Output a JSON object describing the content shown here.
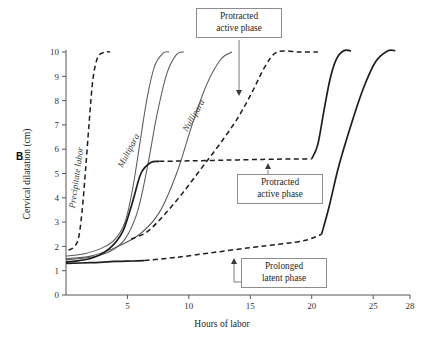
{
  "panel_label": "B",
  "axes": {
    "y_title": "Cervical dilatation (cm)",
    "x_title": "Hours of labor",
    "y_ticks": [
      "0",
      "1",
      "2",
      "3",
      "4",
      "5",
      "6",
      "7",
      "8",
      "9",
      "10"
    ],
    "x_ticks": [
      "5",
      "10",
      "15",
      "20",
      "25",
      "28"
    ],
    "ylim": [
      0,
      10
    ],
    "xlim": [
      0,
      28
    ]
  },
  "annotations": {
    "top_box": "Protracted\nactive phase",
    "top_box_line1": "Protracted",
    "top_box_line2": "active phase",
    "mid_box_line1": "Protracted",
    "mid_box_line2": "active phase",
    "low_box_line1": "Prolonged",
    "low_box_line2": "latent phase"
  },
  "curve_labels": {
    "precipitate": "Precipitate labor",
    "multipara": "Multipara",
    "nullipara": "Nullipara"
  },
  "colors": {
    "ink": "#1d1d1d",
    "thin": "#5a5a5a",
    "axis": "#555555",
    "box_border": "#8d8d8d",
    "background": "#ffffff"
  },
  "chart_data": {
    "type": "line",
    "title": "",
    "xlabel": "Hours of labor",
    "ylabel": "Cervical dilatation (cm)",
    "xlim": [
      0,
      28
    ],
    "ylim": [
      0,
      10
    ],
    "xticks": [
      0,
      5,
      10,
      15,
      20,
      25,
      28
    ],
    "yticks": [
      0,
      1,
      2,
      3,
      4,
      5,
      6,
      7,
      8,
      9,
      10
    ],
    "grid": false,
    "legend": "inline-labels",
    "series": [
      {
        "name": "Precipitate labor",
        "style": "dashed",
        "label": "Precipitate labor",
        "points": [
          [
            0.2,
            1.85
          ],
          [
            0.6,
            1.95
          ],
          [
            1.0,
            2.3
          ],
          [
            1.3,
            3.4
          ],
          [
            1.6,
            5.2
          ],
          [
            1.9,
            7.2
          ],
          [
            2.2,
            8.9
          ],
          [
            2.6,
            9.8
          ],
          [
            3.2,
            10.0
          ],
          [
            3.6,
            10.0
          ]
        ]
      },
      {
        "name": "Multipara",
        "style": "thin",
        "label": "Multipara",
        "points": [
          [
            0,
            1.6
          ],
          [
            1.5,
            1.7
          ],
          [
            3,
            1.95
          ],
          [
            4,
            2.3
          ],
          [
            4.8,
            3.0
          ],
          [
            5.4,
            4.3
          ],
          [
            6.0,
            6.2
          ],
          [
            6.6,
            8.1
          ],
          [
            7.2,
            9.4
          ],
          [
            7.9,
            9.95
          ],
          [
            8.4,
            10.0
          ]
        ]
      },
      {
        "name": "Nullipara",
        "style": "thin",
        "label": "Nullipara",
        "points": [
          [
            0,
            1.5
          ],
          [
            2,
            1.6
          ],
          [
            4,
            1.95
          ],
          [
            6,
            2.5
          ],
          [
            7.6,
            3.4
          ],
          [
            9,
            5.0
          ],
          [
            10.2,
            6.9
          ],
          [
            11.4,
            8.6
          ],
          [
            12.6,
            9.7
          ],
          [
            13.5,
            10.0
          ]
        ]
      },
      {
        "name": "normal-curve-thin-3",
        "style": "thin",
        "label": "",
        "points": [
          [
            0,
            1.45
          ],
          [
            2,
            1.55
          ],
          [
            3.6,
            1.8
          ],
          [
            4.8,
            2.3
          ],
          [
            5.8,
            3.4
          ],
          [
            6.6,
            5.2
          ],
          [
            7.4,
            7.4
          ],
          [
            8.2,
            9.1
          ],
          [
            9.0,
            9.9
          ],
          [
            9.6,
            10.0
          ]
        ]
      },
      {
        "name": "protracted-active-bold-5.5-plateau",
        "style": "bold",
        "label": "",
        "points": [
          [
            0,
            1.35
          ],
          [
            2,
            1.5
          ],
          [
            3.5,
            1.9
          ],
          [
            4.6,
            2.6
          ],
          [
            5.4,
            3.8
          ],
          [
            6.1,
            5.0
          ],
          [
            6.9,
            5.45
          ],
          [
            7.6,
            5.5
          ]
        ]
      },
      {
        "name": "protracted-active-dashed-plateau",
        "style": "dashed",
        "label": "",
        "points": [
          [
            7.6,
            5.5
          ],
          [
            10,
            5.52
          ],
          [
            13,
            5.55
          ],
          [
            16,
            5.58
          ],
          [
            18.5,
            5.6
          ],
          [
            20,
            5.6
          ]
        ]
      },
      {
        "name": "protracted-active-dashed-rise",
        "style": "dashed",
        "label": "",
        "points": [
          [
            5.3,
            2.3
          ],
          [
            6.6,
            2.6
          ],
          [
            8.0,
            3.3
          ],
          [
            9.5,
            4.2
          ],
          [
            11,
            5.2
          ],
          [
            12.5,
            6.2
          ],
          [
            14,
            7.3
          ],
          [
            15.2,
            8.4
          ],
          [
            16.2,
            9.4
          ],
          [
            17.2,
            10.0
          ],
          [
            19,
            10.0
          ],
          [
            20.5,
            10.0
          ]
        ]
      },
      {
        "name": "protracted-bold-rise-to-10",
        "style": "bold",
        "label": "",
        "points": [
          [
            20,
            5.6
          ],
          [
            20.5,
            6.2
          ],
          [
            21,
            7.6
          ],
          [
            21.5,
            8.9
          ],
          [
            22.0,
            9.7
          ],
          [
            22.6,
            10.05
          ],
          [
            23.2,
            10.05
          ]
        ]
      },
      {
        "name": "prolonged-latent-bold-flat",
        "style": "bold",
        "label": "",
        "points": [
          [
            0,
            1.3
          ],
          [
            2,
            1.33
          ],
          [
            4,
            1.38
          ],
          [
            5.5,
            1.4
          ],
          [
            6.4,
            1.42
          ]
        ]
      },
      {
        "name": "prolonged-latent-dashed",
        "style": "dashed",
        "label": "",
        "points": [
          [
            6.4,
            1.42
          ],
          [
            9,
            1.55
          ],
          [
            12,
            1.75
          ],
          [
            15,
            1.95
          ],
          [
            17.5,
            2.1
          ],
          [
            19.5,
            2.25
          ],
          [
            20.8,
            2.5
          ]
        ]
      },
      {
        "name": "prolonged-latent-bold-rise",
        "style": "bold",
        "label": "",
        "points": [
          [
            20.8,
            2.5
          ],
          [
            21.4,
            3.6
          ],
          [
            22.2,
            5.3
          ],
          [
            23.2,
            7.0
          ],
          [
            24.2,
            8.5
          ],
          [
            25.2,
            9.6
          ],
          [
            26.2,
            10.05
          ],
          [
            26.8,
            10.05
          ]
        ]
      }
    ]
  }
}
